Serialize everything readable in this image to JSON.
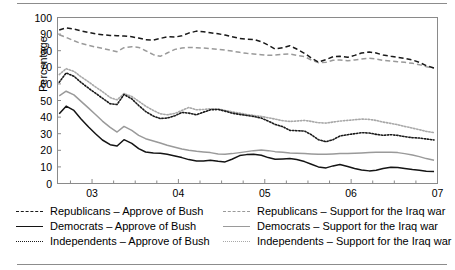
{
  "chart_data": {
    "type": "line",
    "title": "",
    "xlabel": "",
    "ylabel": "Percentage",
    "ylim": [
      0,
      100
    ],
    "yticks": [
      0,
      10,
      20,
      30,
      40,
      50,
      60,
      70,
      80,
      90,
      100
    ],
    "xlim": [
      2002.6,
      2007.0
    ],
    "xticks": [
      2003,
      2004,
      2005,
      2006,
      2007
    ],
    "xticklabels": [
      "03",
      "04",
      "05",
      "06",
      "07"
    ],
    "xminor_interval": 0.25,
    "grid": false,
    "legend_position": "below-axes-two-columns",
    "x": [
      2002.62,
      2002.7,
      2002.79,
      2002.87,
      2002.96,
      2003.04,
      2003.12,
      2003.21,
      2003.29,
      2003.37,
      2003.46,
      2003.54,
      2003.62,
      2003.71,
      2003.79,
      2003.87,
      2003.96,
      2004.04,
      2004.12,
      2004.21,
      2004.29,
      2004.37,
      2004.46,
      2004.54,
      2004.62,
      2004.71,
      2004.79,
      2004.87,
      2004.96,
      2005.04,
      2005.12,
      2005.21,
      2005.29,
      2005.37,
      2005.46,
      2005.54,
      2005.62,
      2005.71,
      2005.79,
      2005.87,
      2005.96,
      2006.04,
      2006.12,
      2006.21,
      2006.29,
      2006.37,
      2006.46,
      2006.54,
      2006.62,
      2006.71,
      2006.79,
      2006.87,
      2006.96
    ],
    "series": [
      {
        "name": "Republicans – Approve of Bush",
        "group": "Approve of Bush",
        "party": "Republicans",
        "color": "#1a1a1a",
        "style": "dashed",
        "values": [
          92.5,
          93.8,
          93.0,
          92.0,
          91.0,
          90.2,
          89.6,
          89.2,
          89.0,
          88.8,
          88.4,
          87.6,
          86.6,
          86.4,
          87.4,
          88.4,
          88.2,
          89.0,
          90.6,
          91.8,
          91.4,
          90.8,
          90.2,
          89.4,
          88.4,
          87.4,
          87.0,
          86.8,
          85.4,
          83.4,
          81.0,
          81.8,
          83.0,
          81.0,
          78.4,
          75.6,
          73.2,
          74.6,
          76.4,
          76.6,
          76.0,
          77.2,
          78.6,
          79.2,
          78.6,
          77.4,
          76.6,
          76.0,
          75.4,
          74.4,
          73.0,
          71.0,
          69.6
        ]
      },
      {
        "name": "Democrats – Approve of Bush",
        "group": "Approve of Bush",
        "party": "Democrats",
        "color": "#141414",
        "style": "solid",
        "values": [
          42.0,
          46.6,
          44.0,
          39.0,
          34.0,
          30.0,
          26.2,
          23.4,
          22.6,
          26.4,
          24.2,
          21.0,
          19.0,
          18.4,
          18.2,
          17.6,
          16.6,
          15.6,
          14.4,
          13.6,
          13.6,
          14.0,
          13.4,
          13.0,
          14.6,
          16.8,
          17.4,
          17.6,
          17.0,
          15.6,
          14.6,
          14.8,
          15.0,
          14.4,
          13.2,
          11.6,
          10.0,
          9.4,
          10.6,
          11.4,
          10.2,
          9.0,
          8.2,
          7.6,
          8.0,
          9.0,
          9.8,
          9.6,
          9.0,
          8.4,
          8.0,
          7.4,
          7.2
        ]
      },
      {
        "name": "Independents – Approve of Bush",
        "group": "Approve of Bush",
        "party": "Independents",
        "color": "#1a1a1a",
        "style": "dotted",
        "values": [
          61.0,
          66.6,
          64.6,
          61.0,
          57.4,
          54.4,
          51.4,
          48.0,
          47.6,
          53.6,
          51.0,
          47.0,
          43.4,
          40.6,
          39.2,
          39.4,
          40.8,
          42.8,
          42.4,
          41.4,
          43.0,
          44.4,
          44.6,
          43.6,
          42.4,
          41.6,
          41.0,
          40.4,
          39.4,
          37.6,
          35.6,
          34.2,
          32.0,
          31.8,
          31.6,
          29.4,
          26.4,
          25.2,
          26.4,
          28.6,
          29.4,
          30.0,
          30.6,
          30.4,
          29.6,
          29.0,
          29.4,
          29.0,
          28.2,
          27.6,
          27.4,
          26.8,
          26.2
        ]
      },
      {
        "name": "Republicans – Support for the Iraq war",
        "group": "Support for the Iraq war",
        "party": "Republicans",
        "color": "#9a9a9a",
        "style": "dashed",
        "values": [
          89.6,
          88.0,
          86.0,
          84.4,
          83.2,
          82.2,
          81.4,
          80.4,
          79.4,
          81.8,
          82.4,
          82.0,
          80.0,
          77.6,
          76.6,
          78.6,
          80.8,
          81.6,
          82.0,
          81.8,
          81.6,
          81.2,
          80.8,
          80.4,
          79.8,
          79.0,
          78.4,
          78.0,
          77.6,
          77.2,
          77.4,
          77.8,
          78.0,
          77.2,
          76.4,
          74.4,
          72.8,
          73.0,
          74.2,
          74.4,
          74.0,
          74.4,
          75.0,
          75.4,
          75.0,
          74.2,
          73.8,
          73.4,
          73.0,
          72.4,
          71.6,
          70.4,
          69.6
        ]
      },
      {
        "name": "Democrats – Support for the Iraq war",
        "group": "Support for the Iraq war",
        "party": "Democrats",
        "color": "#9a9a9a",
        "style": "solid",
        "values": [
          52.8,
          55.6,
          53.4,
          49.6,
          45.4,
          41.6,
          37.6,
          33.8,
          31.0,
          34.4,
          32.0,
          29.0,
          27.0,
          25.6,
          24.4,
          23.0,
          21.8,
          20.8,
          20.0,
          19.4,
          19.0,
          18.6,
          17.8,
          17.6,
          18.0,
          18.6,
          19.2,
          19.8,
          20.2,
          19.8,
          19.2,
          18.8,
          18.4,
          18.2,
          18.0,
          17.8,
          17.6,
          17.6,
          17.8,
          18.0,
          18.0,
          18.2,
          18.4,
          18.6,
          18.8,
          18.8,
          18.8,
          18.6,
          18.0,
          17.2,
          16.2,
          15.0,
          14.0
        ]
      },
      {
        "name": "Independents – Support for the Iraq war",
        "group": "Support for the Iraq war",
        "party": "Independents",
        "color": "#a8a8a8",
        "style": "dotted",
        "values": [
          65.6,
          69.2,
          67.6,
          64.4,
          61.2,
          58.2,
          55.4,
          51.8,
          50.4,
          54.2,
          52.4,
          49.6,
          46.6,
          44.0,
          42.0,
          41.4,
          42.2,
          44.0,
          45.8,
          44.4,
          44.6,
          45.0,
          44.8,
          44.0,
          43.2,
          42.4,
          41.6,
          41.0,
          40.4,
          39.6,
          38.8,
          37.8,
          37.4,
          37.6,
          38.0,
          37.4,
          36.6,
          36.4,
          37.0,
          37.6,
          38.0,
          38.4,
          38.8,
          38.6,
          38.0,
          37.0,
          36.2,
          35.4,
          34.4,
          33.4,
          32.4,
          31.4,
          30.6
        ]
      }
    ]
  },
  "axes": {
    "ylabel": "Percentage",
    "yticklabels": [
      "100",
      "90",
      "80",
      "70",
      "60",
      "50",
      "40",
      "30",
      "20",
      "10",
      "0"
    ],
    "xticklabels": [
      "03",
      "04",
      "05",
      "06",
      "07"
    ]
  },
  "legend": {
    "rows": [
      {
        "left": {
          "label": "Republicans – Approve of Bush",
          "style": "dashed",
          "color": "#1a1a1a"
        },
        "right": {
          "label": "Republicans – Support for the Iraq war",
          "style": "dashed",
          "color": "#9a9a9a"
        }
      },
      {
        "left": {
          "label": "Democrats – Approve of Bush",
          "style": "solid",
          "color": "#141414"
        },
        "right": {
          "label": "Democrats – Support for the Iraq war",
          "style": "solid",
          "color": "#9a9a9a"
        }
      },
      {
        "left": {
          "label": "Independents – Approve of Bush",
          "style": "dotted",
          "color": "#1a1a1a"
        },
        "right": {
          "label": "Independents – Support for the Iraq war",
          "style": "dotted",
          "color": "#a8a8a8"
        }
      }
    ]
  },
  "colors": {
    "approve": "#1a1a1a",
    "support": "#9a9a9a",
    "frame": "#8a8a8a",
    "rule": "#8c8c8c"
  }
}
